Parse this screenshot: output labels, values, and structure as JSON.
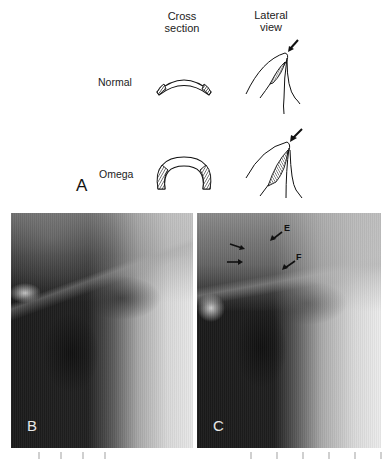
{
  "figure": {
    "panel_a": {
      "letter": "A",
      "column_headers": {
        "cross_section": [
          "Cross",
          "section"
        ],
        "lateral_view": [
          "Lateral",
          "view"
        ]
      },
      "rows": [
        {
          "label": "Normal",
          "cross_section_shape": "shallow-arc-epiglottis",
          "lateral_shape": "narrow-hatched-fold"
        },
        {
          "label": "Omega",
          "cross_section_shape": "omega-shaped-epiglottis",
          "lateral_shape": "wide-hatched-fold"
        }
      ],
      "arrow_icon": "pointer-arrow"
    },
    "panel_b": {
      "letter": "B",
      "type": "radiograph"
    },
    "panel_c": {
      "letter": "C",
      "type": "radiograph",
      "annotations": [
        {
          "label": "E"
        },
        {
          "label": "F"
        }
      ],
      "unlabeled_arrows": 2
    }
  },
  "colors": {
    "background": "#ffffff",
    "ink": "#1a1a1a",
    "xray_dark": "#1c1c1c",
    "xray_light": "#e6e6e6",
    "panel_label": "#e8e8e8"
  }
}
